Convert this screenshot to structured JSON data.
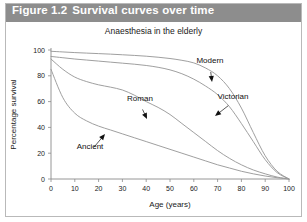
{
  "figure": {
    "number": "Figure 1.2",
    "caption": "Survival curves over time"
  },
  "chart_data": {
    "type": "line",
    "title": "Anaesthesia in the elderly",
    "xlabel": "Age (years)",
    "ylabel": "Percentage survival",
    "xlim": [
      0,
      100
    ],
    "ylim": [
      0,
      100
    ],
    "xticks": [
      "0",
      "10",
      "20",
      "30",
      "40",
      "50",
      "60",
      "70",
      "80",
      "90",
      "100"
    ],
    "yticks": [
      "0",
      "20",
      "40",
      "60",
      "80",
      "100"
    ],
    "grid": false,
    "legend": "annotated-inline",
    "x": [
      0,
      5,
      10,
      15,
      20,
      25,
      30,
      35,
      40,
      45,
      50,
      55,
      60,
      65,
      70,
      75,
      80,
      85,
      90,
      95,
      100
    ],
    "series": [
      {
        "name": "Modern",
        "values": [
          99,
          98.5,
          98,
          97.6,
          97.2,
          96.8,
          96.3,
          95.8,
          95.2,
          94.4,
          93.4,
          92,
          90,
          86,
          80,
          70,
          55,
          36,
          18,
          6,
          0
        ]
      },
      {
        "name": "Victorian",
        "values": [
          95,
          94,
          93,
          92.2,
          91.4,
          90.6,
          89.8,
          89,
          88,
          86.6,
          84.6,
          81.6,
          77.4,
          72,
          65.4,
          56,
          43,
          29,
          15,
          5,
          0
        ]
      },
      {
        "name": "Roman",
        "values": [
          93,
          85,
          79,
          75.5,
          73,
          71.2,
          69,
          65,
          60,
          55.5,
          50,
          43,
          36,
          29,
          22,
          16,
          11,
          7,
          4,
          1.5,
          0
        ]
      },
      {
        "name": "Ancient",
        "values": [
          85,
          63,
          51,
          45,
          41,
          38,
          35,
          32,
          29,
          26,
          23,
          20,
          17,
          14,
          11,
          8.5,
          6,
          4,
          2.3,
          1,
          0
        ]
      }
    ],
    "annotations": [
      {
        "label": "Modern",
        "label_x": 210,
        "label_y": 63,
        "tip_x": 212,
        "tip_y": 82
      },
      {
        "label": "Victorian",
        "label_x": 233,
        "label_y": 99,
        "tip_x": 215,
        "tip_y": 116
      },
      {
        "label": "Roman",
        "label_x": 140,
        "label_y": 101,
        "tip_x": 147,
        "tip_y": 119
      },
      {
        "label": "Ancient",
        "label_x": 90,
        "label_y": 149,
        "tip_x": 105,
        "tip_y": 134
      }
    ]
  }
}
